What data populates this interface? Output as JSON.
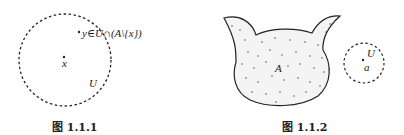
{
  "figures": [
    {
      "caption": "图 1.1.1",
      "labels": {
        "point_x": "x",
        "set_U": "U",
        "point_y_expr": "y∈U̇∩(A\\{x})"
      }
    },
    {
      "caption": "图 1.1.2",
      "labels": {
        "set_A": "A",
        "set_U": "U",
        "point_a": "a"
      }
    }
  ]
}
